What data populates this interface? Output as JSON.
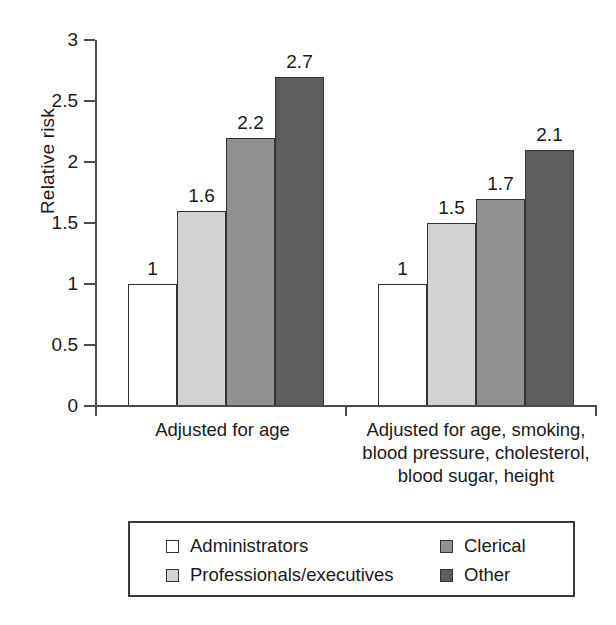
{
  "chart_data": {
    "type": "bar",
    "title": "",
    "xlabel": "",
    "ylabel": "Relative risk",
    "ylim": [
      0,
      3
    ],
    "grid": false,
    "legend_position": "bottom",
    "categories": [
      "Adjusted for age",
      "Adjusted for age, smoking,\nblood pressure, cholesterol,\nblood sugar, height"
    ],
    "y_ticks": [
      "0",
      "0.5",
      "1",
      "1.5",
      "2",
      "2.5",
      "3"
    ],
    "y_tick_values": [
      0,
      0.5,
      1,
      1.5,
      2,
      2.5,
      3
    ],
    "series": [
      {
        "name": "Administrators",
        "color": "#ffffff",
        "values": [
          1,
          1
        ]
      },
      {
        "name": "Professionals/executives",
        "color": "#d3d3d3",
        "values": [
          1.6,
          1.5
        ]
      },
      {
        "name": "Clerical",
        "color": "#919191",
        "values": [
          2.2,
          1.7
        ]
      },
      {
        "name": "Other",
        "color": "#5d5d5d",
        "values": [
          2.7,
          2.1
        ]
      }
    ],
    "value_labels": [
      [
        "1",
        "1.6",
        "2.2",
        "2.7"
      ],
      [
        "1",
        "1.5",
        "1.7",
        "2.1"
      ]
    ]
  },
  "legend": {
    "items": [
      {
        "label": "Administrators",
        "color": "#ffffff"
      },
      {
        "label": "Professionals/executives",
        "color": "#d3d3d3"
      },
      {
        "label": "Clerical",
        "color": "#919191"
      },
      {
        "label": "Other",
        "color": "#5d5d5d"
      }
    ]
  },
  "axis": {
    "y_title": "Relative risk"
  }
}
